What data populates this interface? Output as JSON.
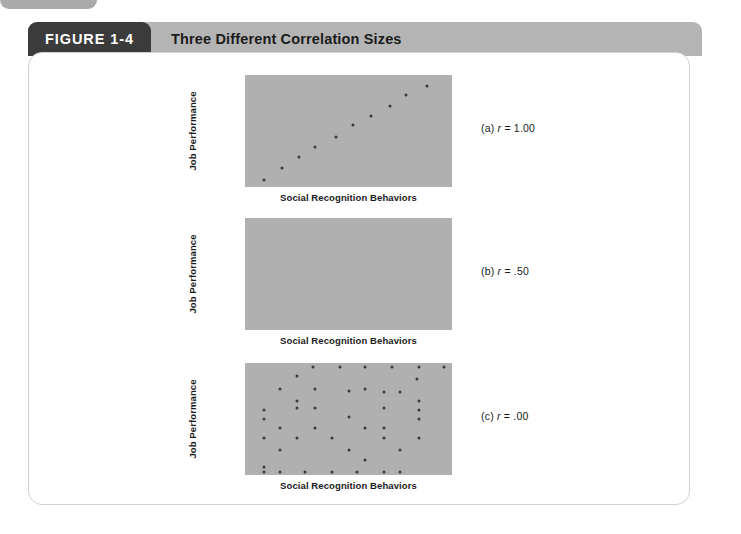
{
  "page": {
    "corner_tab_color": "#aaaaaa",
    "background_color": "#ffffff"
  },
  "figure": {
    "tag_label": "FIGURE 1-4",
    "title": "Three Different Correlation Sizes",
    "tag_background": "#3b3b3b",
    "header_background": "#b4b4b4",
    "plot_background": "#b0b0b0",
    "dot_color": "#3a3a3a"
  },
  "axes": {
    "y_label": "Job Performance",
    "x_label": "Social Recognition Behaviors"
  },
  "captions": {
    "a": {
      "prefix": "(a)",
      "symbol": "r",
      "equals": "=",
      "value": "1.00"
    },
    "b": {
      "prefix": "(b)",
      "symbol": "r",
      "equals": "=",
      "value": ".50"
    },
    "c": {
      "prefix": "(c)",
      "symbol": "r",
      "equals": "=",
      "value": ".00"
    }
  },
  "chart_data": [
    {
      "type": "scatter",
      "id": "a",
      "title": "(a) r = 1.00",
      "xlabel": "Social Recognition Behaviors",
      "ylabel": "Job Performance",
      "correlation": 1.0,
      "xlim": [
        0,
        100
      ],
      "ylim": [
        0,
        100
      ],
      "grid": false,
      "legend": null,
      "points": [
        {
          "x": 9,
          "y": 6
        },
        {
          "x": 18,
          "y": 17
        },
        {
          "x": 26,
          "y": 27
        },
        {
          "x": 34,
          "y": 36
        },
        {
          "x": 44,
          "y": 45
        },
        {
          "x": 52,
          "y": 55
        },
        {
          "x": 61,
          "y": 63
        },
        {
          "x": 70,
          "y": 72
        },
        {
          "x": 78,
          "y": 82
        },
        {
          "x": 88,
          "y": 90
        }
      ]
    },
    {
      "type": "scatter",
      "id": "b",
      "title": "(b) r = .50",
      "xlabel": "Social Recognition Behaviors",
      "ylabel": "Job Performance",
      "correlation": 0.5,
      "xlim": [
        0,
        100
      ],
      "ylim": [
        0,
        100
      ],
      "grid": false,
      "legend": null,
      "points": []
    },
    {
      "type": "scatter",
      "id": "c",
      "title": "(c) r = .00",
      "xlabel": "Social Recognition Behaviors",
      "ylabel": "Job Performance",
      "correlation": 0.0,
      "xlim": [
        0,
        100
      ],
      "ylim": [
        0,
        100
      ],
      "grid": false,
      "legend": null,
      "points": [
        {
          "x": 33,
          "y": 96
        },
        {
          "x": 46,
          "y": 96
        },
        {
          "x": 58,
          "y": 96
        },
        {
          "x": 71,
          "y": 96
        },
        {
          "x": 84,
          "y": 96
        },
        {
          "x": 96,
          "y": 96
        },
        {
          "x": 25,
          "y": 88
        },
        {
          "x": 83,
          "y": 86
        },
        {
          "x": 17,
          "y": 77
        },
        {
          "x": 34,
          "y": 77
        },
        {
          "x": 50,
          "y": 75
        },
        {
          "x": 58,
          "y": 77
        },
        {
          "x": 67,
          "y": 74
        },
        {
          "x": 75,
          "y": 74
        },
        {
          "x": 25,
          "y": 66
        },
        {
          "x": 84,
          "y": 66
        },
        {
          "x": 9,
          "y": 58
        },
        {
          "x": 25,
          "y": 60
        },
        {
          "x": 34,
          "y": 60
        },
        {
          "x": 67,
          "y": 60
        },
        {
          "x": 84,
          "y": 58
        },
        {
          "x": 9,
          "y": 50
        },
        {
          "x": 50,
          "y": 52
        },
        {
          "x": 84,
          "y": 50
        },
        {
          "x": 17,
          "y": 42
        },
        {
          "x": 34,
          "y": 42
        },
        {
          "x": 58,
          "y": 42
        },
        {
          "x": 67,
          "y": 42
        },
        {
          "x": 9,
          "y": 33
        },
        {
          "x": 25,
          "y": 33
        },
        {
          "x": 42,
          "y": 33
        },
        {
          "x": 67,
          "y": 33
        },
        {
          "x": 84,
          "y": 33
        },
        {
          "x": 17,
          "y": 22
        },
        {
          "x": 50,
          "y": 22
        },
        {
          "x": 75,
          "y": 22
        },
        {
          "x": 58,
          "y": 13
        },
        {
          "x": 9,
          "y": 7
        },
        {
          "x": 9,
          "y": 3
        },
        {
          "x": 17,
          "y": 3
        },
        {
          "x": 29,
          "y": 3
        },
        {
          "x": 42,
          "y": 3
        },
        {
          "x": 54,
          "y": 3
        },
        {
          "x": 67,
          "y": 3
        },
        {
          "x": 75,
          "y": 3
        }
      ]
    }
  ]
}
